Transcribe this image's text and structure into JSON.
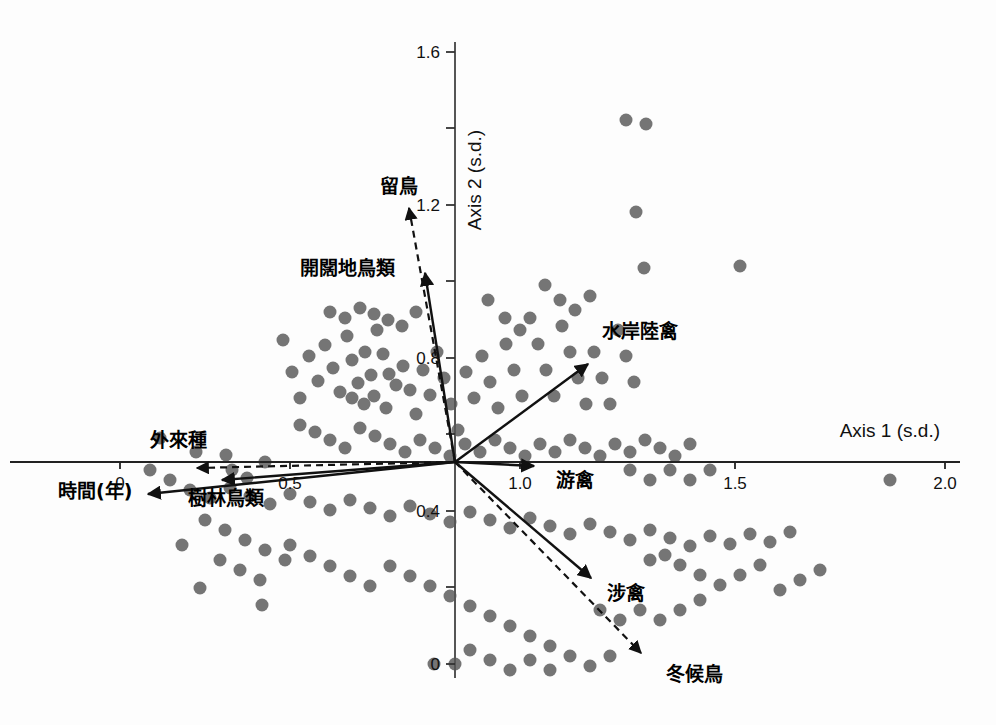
{
  "figure": {
    "type": "ordination-biplot",
    "background_color": "#fdfdfd",
    "point_color": "#6e6e6e",
    "vector_color": "#111111"
  },
  "axes": {
    "x": {
      "label": "Axis 1 (s.d.)",
      "ticks": [
        {
          "value": "0",
          "px": 120
        },
        {
          "value": "0.5",
          "px": 290
        },
        {
          "value": "1.0",
          "px": 520
        },
        {
          "value": "1.5",
          "px": 735
        },
        {
          "value": "2.0",
          "px": 945
        }
      ],
      "line_y_px": 462,
      "line_x_start_px": 10,
      "line_x_end_px": 960
    },
    "y": {
      "label": "Axis 2 (s.d.)",
      "ticks": [
        {
          "value": "1.6",
          "px": 52,
          "labeled": true
        },
        {
          "value": "",
          "px": 128,
          "labeled": false
        },
        {
          "value": "1.2",
          "px": 205,
          "labeled": true
        },
        {
          "value": "",
          "px": 281,
          "labeled": false
        },
        {
          "value": "0.8",
          "px": 358,
          "labeled": true
        },
        {
          "value": "",
          "px": 434,
          "labeled": false
        },
        {
          "value": "0.4",
          "px": 511,
          "labeled": true
        },
        {
          "value": "",
          "px": 587,
          "labeled": false
        },
        {
          "value": "0",
          "px": 664,
          "labeled": true
        }
      ],
      "line_x_px": 455,
      "line_y_start_px": 42,
      "line_y_end_px": 678
    }
  },
  "vectors": [
    {
      "name": "resident-bird",
      "label": "留鳥",
      "style": "dashed",
      "x1": 455,
      "y1": 462,
      "x2": 409,
      "y2": 208,
      "label_x": 380,
      "label_y": 193
    },
    {
      "name": "open-land-bird",
      "label": "開闊地鳥類",
      "style": "solid",
      "x1": 455,
      "y1": 462,
      "x2": 425,
      "y2": 273,
      "label_x": 300,
      "label_y": 275
    },
    {
      "name": "waterside-land-bird",
      "label": "水岸陸禽",
      "style": "solid",
      "x1": 455,
      "y1": 462,
      "x2": 588,
      "y2": 364,
      "label_x": 602,
      "label_y": 338
    },
    {
      "name": "swimming-bird",
      "label": "游禽",
      "style": "solid",
      "x1": 455,
      "y1": 462,
      "x2": 534,
      "y2": 466,
      "label_x": 556,
      "label_y": 487
    },
    {
      "name": "wading-bird",
      "label": "涉禽",
      "style": "solid",
      "x1": 455,
      "y1": 462,
      "x2": 591,
      "y2": 578,
      "label_x": 607,
      "label_y": 600
    },
    {
      "name": "winter-migrant",
      "label": "冬候鳥",
      "style": "dashed",
      "x1": 455,
      "y1": 462,
      "x2": 641,
      "y2": 653,
      "label_x": 666,
      "label_y": 681
    },
    {
      "name": "exotic-species",
      "label": "外來種",
      "style": "dashed",
      "x1": 455,
      "y1": 462,
      "x2": 197,
      "y2": 468,
      "label_x": 150,
      "label_y": 447
    },
    {
      "name": "forest-bird",
      "label": "樹林鳥類",
      "style": "solid",
      "x1": 455,
      "y1": 462,
      "x2": 222,
      "y2": 480,
      "label_x": 188,
      "label_y": 505
    },
    {
      "name": "time-years",
      "label": "時間(年)",
      "style": "solid",
      "x1": 455,
      "y1": 462,
      "x2": 148,
      "y2": 494,
      "label_x": 58,
      "label_y": 498
    }
  ],
  "chart_data": {
    "type": "scatter",
    "title": "",
    "xlabel": "Axis 1 (s.d.)",
    "ylabel": "Axis 2 (s.d.)",
    "xlim": [
      0,
      2.0
    ],
    "ylim": [
      0,
      1.6
    ],
    "grid": false,
    "legend": null,
    "point_marker": "filled-circle",
    "point_radius_px": 6.5,
    "n_points": 186,
    "points_px": [
      [
        160,
        438
      ],
      [
        196,
        452
      ],
      [
        226,
        455
      ],
      [
        232,
        470
      ],
      [
        247,
        478
      ],
      [
        265,
        462
      ],
      [
        283,
        340
      ],
      [
        292,
        372
      ],
      [
        300,
        398
      ],
      [
        309,
        356
      ],
      [
        318,
        381
      ],
      [
        325,
        345
      ],
      [
        333,
        368
      ],
      [
        340,
        392
      ],
      [
        347,
        336
      ],
      [
        352,
        360
      ],
      [
        358,
        383
      ],
      [
        365,
        352
      ],
      [
        371,
        375
      ],
      [
        377,
        330
      ],
      [
        383,
        354
      ],
      [
        389,
        374
      ],
      [
        352,
        398
      ],
      [
        364,
        404
      ],
      [
        374,
        396
      ],
      [
        386,
        408
      ],
      [
        396,
        385
      ],
      [
        403,
        366
      ],
      [
        410,
        390
      ],
      [
        416,
        414
      ],
      [
        423,
        370
      ],
      [
        430,
        395
      ],
      [
        437,
        352
      ],
      [
        444,
        378
      ],
      [
        451,
        404
      ],
      [
        458,
        430
      ],
      [
        466,
        372
      ],
      [
        474,
        398
      ],
      [
        482,
        356
      ],
      [
        490,
        382
      ],
      [
        498,
        408
      ],
      [
        506,
        344
      ],
      [
        514,
        370
      ],
      [
        522,
        396
      ],
      [
        530,
        318
      ],
      [
        538,
        344
      ],
      [
        546,
        370
      ],
      [
        554,
        396
      ],
      [
        562,
        326
      ],
      [
        570,
        352
      ],
      [
        578,
        378
      ],
      [
        586,
        404
      ],
      [
        594,
        352
      ],
      [
        602,
        378
      ],
      [
        610,
        404
      ],
      [
        618,
        330
      ],
      [
        626,
        356
      ],
      [
        634,
        382
      ],
      [
        626,
        120
      ],
      [
        646,
        124
      ],
      [
        636,
        212
      ],
      [
        644,
        268
      ],
      [
        740,
        266
      ],
      [
        330,
        312
      ],
      [
        345,
        318
      ],
      [
        360,
        308
      ],
      [
        374,
        314
      ],
      [
        388,
        320
      ],
      [
        402,
        326
      ],
      [
        416,
        312
      ],
      [
        300,
        425
      ],
      [
        315,
        432
      ],
      [
        330,
        440
      ],
      [
        345,
        448
      ],
      [
        360,
        428
      ],
      [
        375,
        436
      ],
      [
        390,
        444
      ],
      [
        405,
        452
      ],
      [
        420,
        440
      ],
      [
        435,
        448
      ],
      [
        450,
        456
      ],
      [
        465,
        444
      ],
      [
        480,
        452
      ],
      [
        495,
        440
      ],
      [
        510,
        448
      ],
      [
        525,
        456
      ],
      [
        540,
        444
      ],
      [
        555,
        452
      ],
      [
        570,
        440
      ],
      [
        585,
        448
      ],
      [
        600,
        456
      ],
      [
        615,
        444
      ],
      [
        630,
        452
      ],
      [
        645,
        440
      ],
      [
        660,
        448
      ],
      [
        675,
        456
      ],
      [
        690,
        444
      ],
      [
        150,
        470
      ],
      [
        170,
        480
      ],
      [
        190,
        490
      ],
      [
        210,
        498
      ],
      [
        230,
        488
      ],
      [
        250,
        496
      ],
      [
        270,
        504
      ],
      [
        290,
        494
      ],
      [
        310,
        502
      ],
      [
        330,
        510
      ],
      [
        350,
        500
      ],
      [
        370,
        508
      ],
      [
        390,
        516
      ],
      [
        410,
        506
      ],
      [
        430,
        514
      ],
      [
        450,
        522
      ],
      [
        470,
        512
      ],
      [
        490,
        520
      ],
      [
        510,
        528
      ],
      [
        530,
        518
      ],
      [
        550,
        526
      ],
      [
        570,
        534
      ],
      [
        590,
        524
      ],
      [
        610,
        532
      ],
      [
        630,
        540
      ],
      [
        650,
        530
      ],
      [
        670,
        538
      ],
      [
        690,
        546
      ],
      [
        710,
        536
      ],
      [
        730,
        544
      ],
      [
        750,
        534
      ],
      [
        770,
        542
      ],
      [
        790,
        532
      ],
      [
        890,
        480
      ],
      [
        205,
        520
      ],
      [
        225,
        530
      ],
      [
        245,
        540
      ],
      [
        265,
        550
      ],
      [
        285,
        560
      ],
      [
        220,
        560
      ],
      [
        240,
        570
      ],
      [
        260,
        580
      ],
      [
        200,
        588
      ],
      [
        182,
        545
      ],
      [
        262,
        605
      ],
      [
        290,
        545
      ],
      [
        310,
        556
      ],
      [
        330,
        566
      ],
      [
        350,
        576
      ],
      [
        370,
        586
      ],
      [
        390,
        566
      ],
      [
        410,
        576
      ],
      [
        430,
        586
      ],
      [
        450,
        596
      ],
      [
        470,
        606
      ],
      [
        490,
        616
      ],
      [
        510,
        626
      ],
      [
        530,
        636
      ],
      [
        550,
        646
      ],
      [
        570,
        656
      ],
      [
        590,
        666
      ],
      [
        610,
        656
      ],
      [
        470,
        650
      ],
      [
        490,
        660
      ],
      [
        510,
        670
      ],
      [
        530,
        660
      ],
      [
        550,
        670
      ],
      [
        455,
        664
      ],
      [
        434,
        664
      ],
      [
        600,
        610
      ],
      [
        620,
        620
      ],
      [
        640,
        610
      ],
      [
        660,
        620
      ],
      [
        680,
        610
      ],
      [
        700,
        600
      ],
      [
        650,
        560
      ],
      [
        665,
        555
      ],
      [
        680,
        565
      ],
      [
        700,
        575
      ],
      [
        720,
        585
      ],
      [
        740,
        575
      ],
      [
        760,
        565
      ],
      [
        780,
        590
      ],
      [
        800,
        580
      ],
      [
        820,
        570
      ],
      [
        630,
        470
      ],
      [
        650,
        480
      ],
      [
        670,
        470
      ],
      [
        690,
        480
      ],
      [
        710,
        470
      ],
      [
        560,
        300
      ],
      [
        575,
        310
      ],
      [
        545,
        285
      ],
      [
        590,
        296
      ],
      [
        520,
        330
      ],
      [
        505,
        318
      ],
      [
        488,
        300
      ]
    ]
  }
}
